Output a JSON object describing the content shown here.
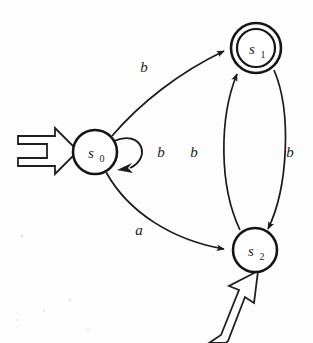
{
  "diagram": {
    "type": "state-machine",
    "background_color": "#fdfdfd",
    "ink_color": "#1a1a1a",
    "states": [
      {
        "id": "s0",
        "label": "s",
        "subscript": "0",
        "shape": "single-circle",
        "accepting": false,
        "start": true,
        "cx": 95,
        "cy": 152,
        "r": 22
      },
      {
        "id": "s1",
        "label": "s",
        "subscript": "1",
        "shape": "double-circle",
        "accepting": true,
        "start": false,
        "cx": 256,
        "cy": 48,
        "r": 25,
        "r_inner": 19
      },
      {
        "id": "s2",
        "label": "s",
        "subscript": "2",
        "shape": "single-circle",
        "accepting": false,
        "start": true,
        "cx": 255,
        "cy": 250,
        "r": 22
      }
    ],
    "transitions": [
      {
        "id": "t-s0-s1",
        "from": "s0",
        "to": "s1",
        "symbol": "b",
        "label_x": 144,
        "label_y": 72
      },
      {
        "id": "t-s0-s0",
        "from": "s0",
        "to": "s0",
        "symbol": "b",
        "label_x": 161,
        "label_y": 157,
        "self_loop": true
      },
      {
        "id": "t-s0-s2",
        "from": "s0",
        "to": "s2",
        "symbol": "a",
        "label_x": 139,
        "label_y": 235
      },
      {
        "id": "t-s2-s1",
        "from": "s2",
        "to": "s1",
        "symbol": "b",
        "label_x": 194,
        "label_y": 157
      },
      {
        "id": "t-s1-s2",
        "from": "s1",
        "to": "s2",
        "symbol": "b",
        "label_x": 290,
        "label_y": 157
      }
    ],
    "start_arrows": [
      {
        "id": "start-arrow-s0",
        "target": "s0",
        "direction": "from-left"
      },
      {
        "id": "start-arrow-s2",
        "target": "s2",
        "direction": "from-bottom-left"
      }
    ]
  }
}
